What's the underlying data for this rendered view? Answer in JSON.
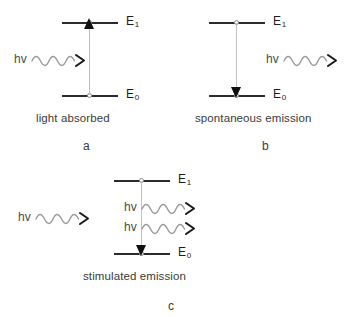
{
  "figure": {
    "background_color": "#ffffff",
    "level_color": "#2b2b2b",
    "transition_color": "#c2c2c2",
    "arrowhead_color": "#101010",
    "wave_color": "#9a9a9a",
    "text_color": "#3a3a3a"
  },
  "labels": {
    "upper_level": "E",
    "upper_level_sub": "1",
    "lower_level": "E",
    "lower_level_sub": "0",
    "photon": "hv"
  },
  "panels": [
    {
      "id": "a",
      "letter": "a",
      "caption": "light absorbed",
      "transition_direction": "up",
      "incoming_photons": 1,
      "outgoing_photons": 0
    },
    {
      "id": "b",
      "letter": "b",
      "caption": "spontaneous emission",
      "transition_direction": "down",
      "incoming_photons": 0,
      "outgoing_photons": 1
    },
    {
      "id": "c",
      "letter": "c",
      "caption": "stimulated emission",
      "transition_direction": "down",
      "incoming_photons": 1,
      "outgoing_photons": 2
    }
  ]
}
